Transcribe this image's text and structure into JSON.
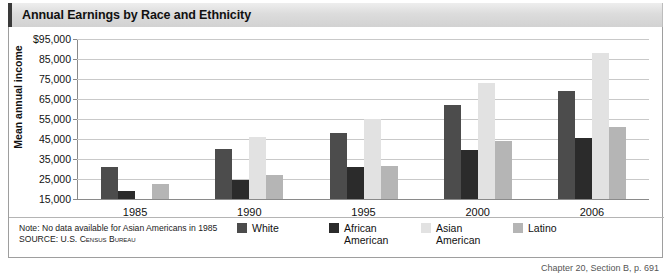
{
  "title": "Annual Earnings by Race and Ethnicity",
  "notes": {
    "note": "Note: No data available for Asian Americans in 1985",
    "source": "SOURCE: U.S. Census Bureau"
  },
  "caption": "Chapter 20, Section B, p. 691",
  "colors": {
    "white": "#4c4c4c",
    "african_american": "#2b2b2b",
    "asian_american": "#e2e2e2",
    "latino": "#b5b5b5",
    "gridline": "#c9c9c9",
    "axis": "#8a8a8a",
    "title_bar_start": "#eeeeee",
    "title_bar_end": "#d2d2d2"
  },
  "chart_data": {
    "type": "bar",
    "title": "Annual Earnings by Race and Ethnicity",
    "xlabel": "",
    "ylabel": "Mean annual income",
    "categories": [
      "1985",
      "1990",
      "1995",
      "2000",
      "2006"
    ],
    "ylim": [
      15000,
      95000
    ],
    "yticks": [
      15000,
      25000,
      35000,
      45000,
      55000,
      65000,
      75000,
      85000,
      95000
    ],
    "ytick_labels": [
      "15,000",
      "25,000",
      "35,000",
      "45,000",
      "55,000",
      "65,000",
      "75,000",
      "85,000",
      "$95,000"
    ],
    "grid": true,
    "legend_position": "bottom",
    "series": [
      {
        "name": "White",
        "color": "#4c4c4c",
        "values": [
          31000,
          40000,
          48000,
          62000,
          69000
        ]
      },
      {
        "name": "African American",
        "color": "#2b2b2b",
        "values": [
          19000,
          24500,
          31000,
          39500,
          45500
        ]
      },
      {
        "name": "Asian American",
        "color": "#e2e2e2",
        "values": [
          null,
          46000,
          55000,
          73000,
          88000
        ]
      },
      {
        "name": "Latino",
        "color": "#b5b5b5",
        "values": [
          22500,
          27000,
          31500,
          44000,
          51000
        ]
      }
    ],
    "annotations": [
      "Note: No data available for Asian Americans in 1985",
      "SOURCE: U.S. Census Bureau"
    ]
  }
}
